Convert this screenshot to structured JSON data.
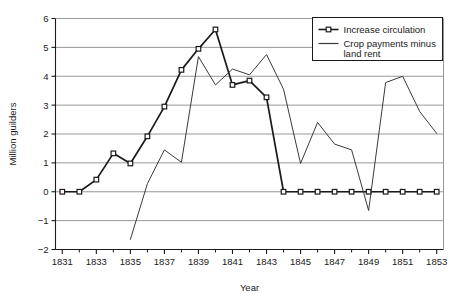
{
  "chart_data": {
    "type": "line",
    "title": "",
    "xlabel": "Year",
    "ylabel": "Million guilders",
    "xlim": [
      1830.6,
      1853.4
    ],
    "ylim": [
      -2,
      6
    ],
    "yticks": [
      -2,
      -1,
      0,
      1,
      2,
      3,
      4,
      5,
      6
    ],
    "ytick_labels": [
      "−2",
      "−1",
      "0",
      "1",
      "2",
      "3",
      "4",
      "5",
      "6"
    ],
    "xticks": [
      1831,
      1833,
      1835,
      1837,
      1839,
      1841,
      1843,
      1845,
      1847,
      1849,
      1851,
      1853
    ],
    "xtick_labels": [
      "1831",
      "1833",
      "1835",
      "1837",
      "1839",
      "1841",
      "1843",
      "1845",
      "1847",
      "1849",
      "1851",
      "1853"
    ],
    "x_minor_ticks": [
      1832,
      1834,
      1836,
      1838,
      1840,
      1842,
      1844,
      1846,
      1848,
      1850,
      1852
    ],
    "grid": "horizontal",
    "legend_position": "top-right",
    "series": [
      {
        "name": "Increase circulation",
        "marker": "open-square",
        "color": "#1a1a1a",
        "x": [
          1831,
          1832,
          1833,
          1834,
          1835,
          1836,
          1837,
          1838,
          1839,
          1840,
          1841,
          1842,
          1843,
          1844,
          1845,
          1846,
          1847,
          1848,
          1849,
          1850,
          1851,
          1852,
          1853
        ],
        "values": [
          0.0,
          0.0,
          0.42,
          1.33,
          0.98,
          1.92,
          2.95,
          4.22,
          4.95,
          5.62,
          3.7,
          3.85,
          3.27,
          0.0,
          0.0,
          0.0,
          0.0,
          0.0,
          0.0,
          0.0,
          0.0,
          0.0,
          0.0
        ]
      },
      {
        "name": "Crop payments minus land rent",
        "marker": "none",
        "color": "#3a3a3a",
        "x": [
          1835,
          1836,
          1837,
          1838,
          1839,
          1840,
          1841,
          1842,
          1843,
          1844,
          1845,
          1846,
          1847,
          1848,
          1849,
          1850,
          1851,
          1852,
          1853
        ],
        "values": [
          -1.65,
          0.28,
          1.45,
          1.02,
          4.68,
          3.7,
          4.25,
          4.05,
          4.75,
          3.55,
          0.98,
          2.4,
          1.65,
          1.45,
          -0.65,
          3.78,
          4.0,
          2.78,
          2.02
        ]
      }
    ],
    "legend": [
      {
        "label": "Increase circulation",
        "marker": "open-square"
      },
      {
        "label": "Crop payments minus",
        "marker": "none"
      },
      {
        "label": "land rent",
        "marker": "none"
      }
    ]
  }
}
